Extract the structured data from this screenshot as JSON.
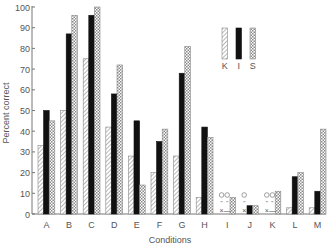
{
  "chart_data": {
    "type": "bar",
    "title": "",
    "xlabel": "Conditions",
    "ylabel": "Percent correct",
    "ylim": [
      0,
      100
    ],
    "yticks": [
      0,
      10,
      20,
      30,
      40,
      50,
      60,
      70,
      80,
      90,
      100
    ],
    "grid": false,
    "legend_position": "upper right",
    "categories": [
      "A",
      "B",
      "C",
      "D",
      "E",
      "F",
      "G",
      "H",
      "I",
      "J",
      "K",
      "L",
      "M"
    ],
    "series": [
      {
        "name": "K",
        "pattern": "diagonal-hatch",
        "color": "#9a9a9a",
        "values": [
          33,
          50,
          75,
          42,
          28,
          20,
          28,
          8,
          0,
          0,
          0,
          3,
          3
        ]
      },
      {
        "name": "I",
        "pattern": "solid",
        "color": "#111111",
        "values": [
          50,
          87,
          96,
          58,
          45,
          35,
          68,
          42,
          0,
          4,
          0,
          18,
          11
        ]
      },
      {
        "name": "S",
        "pattern": "crosshatch",
        "color": "#aaaaaa",
        "values": [
          45,
          96,
          100,
          72,
          14,
          41,
          81,
          37,
          8,
          4,
          11,
          20,
          41
        ]
      }
    ],
    "annotations": [
      {
        "category": "I",
        "series": "K",
        "marks": [
          "○",
          "\"",
          "×"
        ]
      },
      {
        "category": "I",
        "series": "I",
        "marks": [
          "○",
          "\"",
          "—"
        ]
      },
      {
        "category": "J",
        "series": "K",
        "marks": [
          "○",
          "\"",
          "×"
        ]
      },
      {
        "category": "K",
        "series": "K",
        "marks": [
          "○",
          "\"",
          "×"
        ]
      },
      {
        "category": "K",
        "series": "I",
        "marks": [
          "○",
          "\"",
          "—"
        ]
      }
    ]
  }
}
